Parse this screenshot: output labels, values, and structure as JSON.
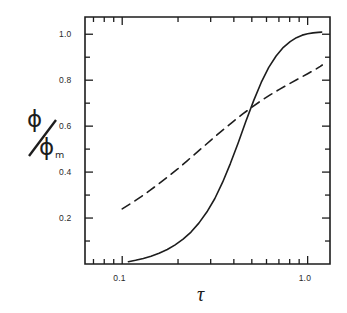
{
  "figure": {
    "background_color": "#ffffff",
    "ink_color": "#1d1d1d"
  },
  "chart_data": {
    "type": "line",
    "title": "",
    "subtitle": "",
    "xlabel": "τ",
    "ylabel": "ϕ/ϕ",
    "ylabel_numerator": "ϕ",
    "ylabel_denominator": "ϕ",
    "ylabel_denominator_subscript": "m",
    "xscale": "log",
    "yscale": "linear",
    "xlim": [
      0.063,
      1.32
    ],
    "ylim": [
      0.0,
      1.075
    ],
    "grid": false,
    "legend": null,
    "legend_position": "none",
    "xtick_labels": [
      "0.1",
      "1.0"
    ],
    "xtick_values": [
      0.1,
      1.0
    ],
    "xminor_ticks": [
      0.07,
      0.08,
      0.09,
      0.2,
      0.3,
      0.4,
      0.5,
      0.6,
      0.7,
      0.8,
      0.9
    ],
    "ytick_labels": [
      "0.2",
      "0.4",
      "0.6",
      "0.8",
      "1.0"
    ],
    "ytick_values": [
      0.2,
      0.4,
      0.6,
      0.8,
      1.0
    ],
    "yminor_ticks": [
      0.1,
      0.3,
      0.5,
      0.7,
      0.9
    ],
    "series": [
      {
        "name": "solid-curve",
        "style": "solid",
        "color": "#1d1d1d",
        "linewidth": 1.6,
        "x": [
          0.108,
          0.118,
          0.13,
          0.143,
          0.158,
          0.175,
          0.193,
          0.213,
          0.235,
          0.259,
          0.286,
          0.316,
          0.348,
          0.383,
          0.422,
          0.464,
          0.511,
          0.562,
          0.617,
          0.676,
          0.74,
          0.805,
          0.87,
          0.935,
          1.0,
          1.07,
          1.14,
          1.19
        ],
        "y": [
          0.01,
          0.016,
          0.024,
          0.034,
          0.047,
          0.063,
          0.083,
          0.108,
          0.139,
          0.178,
          0.226,
          0.285,
          0.356,
          0.437,
          0.527,
          0.62,
          0.71,
          0.79,
          0.856,
          0.905,
          0.943,
          0.968,
          0.985,
          0.996,
          1.002,
          1.006,
          1.008,
          1.009
        ]
      },
      {
        "name": "dashed-curve",
        "style": "dashed",
        "color": "#1d1d1d",
        "linewidth": 1.6,
        "dash_pattern": "9 6",
        "x": [
          0.1,
          0.112,
          0.126,
          0.141,
          0.158,
          0.178,
          0.2,
          0.224,
          0.251,
          0.282,
          0.316,
          0.355,
          0.398,
          0.447,
          0.501,
          0.562,
          0.631,
          0.708,
          0.794,
          0.891,
          1.0,
          1.09,
          1.17,
          1.2
        ],
        "y": [
          0.24,
          0.265,
          0.292,
          0.32,
          0.35,
          0.382,
          0.415,
          0.449,
          0.484,
          0.519,
          0.554,
          0.588,
          0.621,
          0.653,
          0.683,
          0.711,
          0.737,
          0.761,
          0.784,
          0.806,
          0.828,
          0.845,
          0.86,
          0.866
        ]
      }
    ],
    "annotations": [
      {
        "name": "crossover",
        "x": 0.48,
        "y": 0.68,
        "text": ""
      }
    ]
  },
  "axes": {
    "frame": {
      "left_px": 85,
      "right_px": 330,
      "top_px": 17,
      "bottom_px": 264
    },
    "tick_direction": "in",
    "spines": [
      "left",
      "bottom",
      "top",
      "right"
    ]
  }
}
